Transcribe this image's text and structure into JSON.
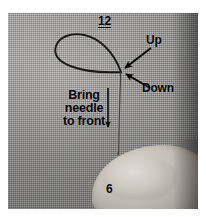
{
  "image": {
    "kind": "instructional-photograph",
    "subject": "embroidery stitch demonstration on gray woven fabric with thread loop, needle and thumb",
    "width": 206,
    "height": 217,
    "background_color": "#ffffff",
    "fabric_color": "#999897",
    "annotation_color": "#000000"
  },
  "annotations": {
    "clock_top": "12",
    "clock_bottom": "6",
    "up_label": "Up",
    "down_label": "Down",
    "instruction": {
      "line1": "Bring",
      "line2": "needle",
      "line3": "to front"
    }
  },
  "markers": [
    {
      "name": "arrow-to-up-point",
      "label": "Up",
      "direction": "down-left"
    },
    {
      "name": "arrow-to-down-point",
      "label": "Down",
      "direction": "up-left"
    },
    {
      "name": "arrow-bring-needle",
      "label": "Bring needle to front",
      "direction": "down"
    }
  ],
  "elements": {
    "thread_loop": "teardrop-loop",
    "needle": "vertical-needle",
    "thumb": "thumb"
  }
}
